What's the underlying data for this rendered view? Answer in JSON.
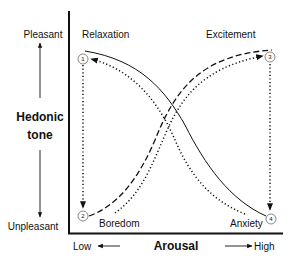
{
  "diagram": {
    "type": "reversal-theory-diagram",
    "y_axis": {
      "title_line1": "Hedonic",
      "title_line2": "tone",
      "top_label": "Pleasant",
      "bottom_label": "Unpleasant"
    },
    "x_axis": {
      "title": "Arousal",
      "left_label": "Low",
      "right_label": "High"
    },
    "states": [
      {
        "id": "1",
        "name": "Relaxation",
        "arousal": "low",
        "hedonic_tone": "pleasant"
      },
      {
        "id": "2",
        "name": "Boredom",
        "arousal": "low",
        "hedonic_tone": "unpleasant"
      },
      {
        "id": "3",
        "name": "Excitement",
        "arousal": "high",
        "hedonic_tone": "pleasant"
      },
      {
        "id": "4",
        "name": "Anxiety",
        "arousal": "high",
        "hedonic_tone": "unpleasant"
      }
    ],
    "curves": [
      {
        "name": "telic-curve",
        "style": "solid",
        "from": "Relaxation",
        "to": "Anxiety"
      },
      {
        "name": "paratelic-curve",
        "style": "dashed",
        "from": "Boredom",
        "to": "Excitement"
      }
    ],
    "transitions": [
      {
        "style": "dotted",
        "from": "1",
        "to": "2",
        "direction": "down"
      },
      {
        "style": "dotted",
        "from": "2",
        "to": "3",
        "direction": "up-right"
      },
      {
        "style": "dotted",
        "from": "3",
        "to": "4",
        "direction": "down"
      },
      {
        "style": "dotted",
        "from": "4",
        "to": "1",
        "direction": "up-left"
      }
    ]
  }
}
